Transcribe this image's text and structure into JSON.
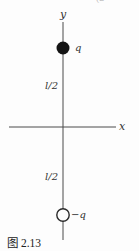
{
  "figure": {
    "caption": "图 2.13",
    "cropped_top_text": "(2",
    "axes": {
      "x_label": "x",
      "y_label": "y"
    },
    "charges": {
      "positive_label": "q",
      "negative_label": "−q"
    },
    "distances": {
      "upper_label": "l/2",
      "lower_label": "l/2"
    },
    "colors": {
      "background": "#fdfdfd",
      "line": "#4a4a4a",
      "text": "#333333",
      "charge_fill": "#141414",
      "charge_open_stroke": "#2a2a2a"
    }
  }
}
